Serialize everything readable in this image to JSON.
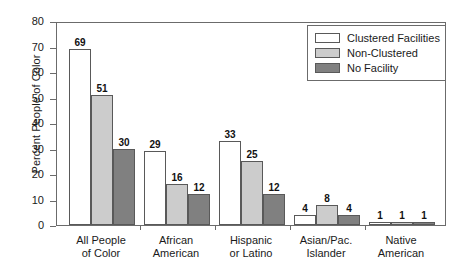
{
  "chart_data": {
    "type": "bar",
    "title": "",
    "xlabel": "",
    "ylabel": "Percent People of Color",
    "ylim": [
      0,
      80
    ],
    "yticks": [
      0,
      10,
      20,
      30,
      40,
      50,
      60,
      70,
      80
    ],
    "grid": false,
    "legend_position": "top-right",
    "categories": [
      "All People\nof Color",
      "African\nAmerican",
      "Hispanic\nor Latino",
      "Asian/Pac.\nIslander",
      "Native\nAmerican"
    ],
    "category_lines": [
      [
        "All People",
        "of Color"
      ],
      [
        "African",
        "American"
      ],
      [
        "Hispanic",
        "or Latino"
      ],
      [
        "Asian/Pac.",
        "Islander"
      ],
      [
        "Native",
        "American"
      ]
    ],
    "series": [
      {
        "name": "Clustered Facilities",
        "color": "#ffffff",
        "values": [
          69,
          29,
          33,
          4,
          1
        ]
      },
      {
        "name": "Non-Clustered",
        "color": "#cccccc",
        "values": [
          51,
          16,
          25,
          8,
          1
        ]
      },
      {
        "name": "No Facility",
        "color": "#808080",
        "values": [
          30,
          12,
          12,
          4,
          1
        ]
      }
    ]
  },
  "legend": {
    "items": [
      {
        "label": "Clustered Facilities",
        "color": "#ffffff"
      },
      {
        "label": "Non-Clustered",
        "color": "#cccccc"
      },
      {
        "label": "No Facility",
        "color": "#808080"
      }
    ]
  },
  "axes": {
    "y_title": "Percent People of Color",
    "y_tick_labels": [
      "0",
      "10",
      "20",
      "30",
      "40",
      "50",
      "60",
      "70",
      "80"
    ]
  },
  "colors": {
    "frame": "#6b6b6b",
    "bar_outline": "#595959",
    "background": "#ffffff",
    "text": "#1a1a1a"
  }
}
